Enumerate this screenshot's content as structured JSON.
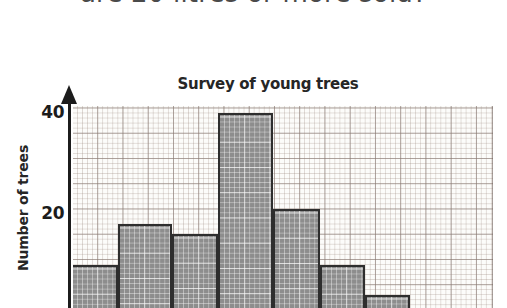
{
  "question": {
    "text": "are 20 litres or more sold?"
  },
  "chart_data": {
    "type": "bar",
    "title": "Survey of young trees",
    "xlabel": "",
    "ylabel": "Number of trees",
    "categories": [
      "1",
      "2",
      "3",
      "4",
      "5",
      "6",
      "7"
    ],
    "values": [
      10,
      18,
      16,
      40,
      21,
      10,
      4
    ],
    "ylim": [
      0,
      42
    ],
    "ytick_labels": [
      "20",
      "40"
    ],
    "ytick_values": [
      20,
      40
    ],
    "grid": true,
    "grid_style": "graph-paper",
    "legend": "none",
    "bar_fill_color": "#8d8d8d",
    "bar_edge_color": "#2e2e2e",
    "axis_color": "#1c1c1c",
    "note": "histogram bars are contiguous; x-axis labels are cropped below the image edge"
  }
}
